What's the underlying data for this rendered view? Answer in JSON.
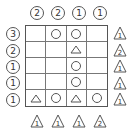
{
  "puzzle": {
    "columns": 4,
    "rows": 5,
    "top_clues": [
      "2",
      "2",
      "1",
      "1"
    ],
    "left_clues": [
      "3",
      "2",
      "1",
      "1",
      "1"
    ],
    "right_triangle_clues": [
      "1",
      "2",
      "1",
      "1",
      "1"
    ],
    "bottom_triangle_clues": [
      "1",
      "1",
      "1",
      "2"
    ],
    "cells": [
      [
        "",
        "circle",
        "circle",
        ""
      ],
      [
        "",
        "",
        "triangle",
        ""
      ],
      [
        "",
        "",
        "circle",
        ""
      ],
      [
        "",
        "",
        "circle",
        ""
      ],
      [
        "triangle",
        "circle",
        "triangle",
        "circle"
      ]
    ]
  },
  "glyphs": {
    "circle_clue": [
      "①",
      "②",
      "③"
    ]
  }
}
